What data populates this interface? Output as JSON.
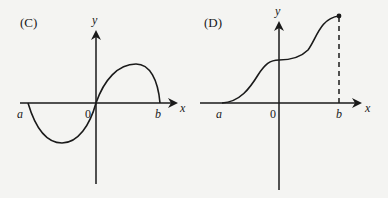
{
  "panels": [
    {
      "label": "(C)",
      "x_axis": "x",
      "y_axis": "y",
      "ticks": {
        "a": "a",
        "origin": "0",
        "b": "b"
      },
      "description": "Curve crosses x-axis at a, 0 and b; negative trough between a and 0, positive hump between 0 and b"
    },
    {
      "label": "(D)",
      "x_axis": "x",
      "y_axis": "y",
      "ticks": {
        "a": "a",
        "origin": "0",
        "b": "b"
      },
      "description": "Increasing curve from a to b with inflection plateau near y-axis, ending in a filled dot at b with dashed vertical line to x-axis"
    }
  ],
  "colors": {
    "ink": "#1a1a1a",
    "background": "#f4f4f2"
  }
}
